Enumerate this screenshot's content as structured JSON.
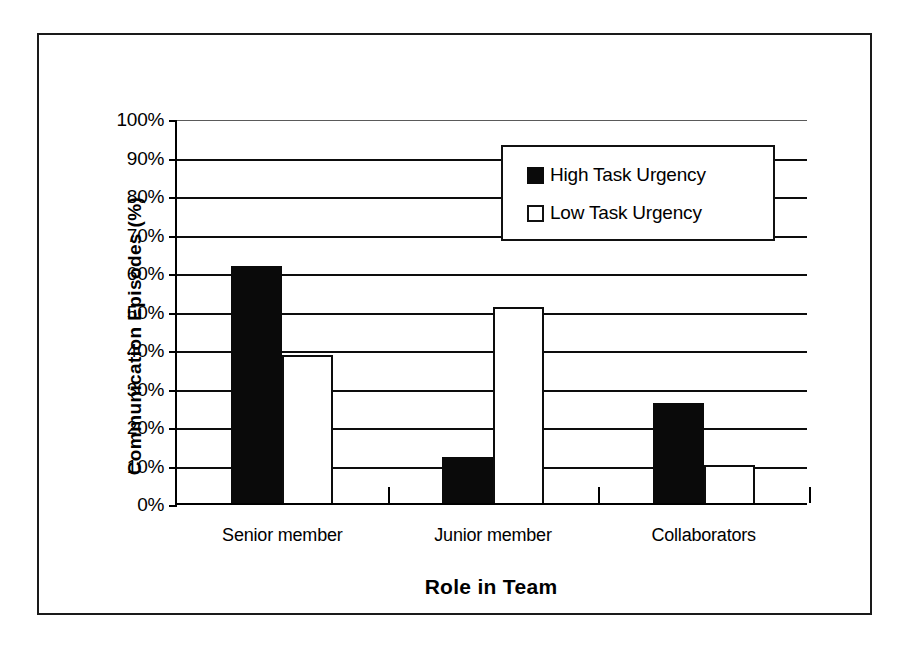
{
  "chart_data": {
    "type": "bar",
    "title": "",
    "xlabel": "Role in Team",
    "ylabel": "Communication Episodes (%)",
    "categories": [
      "Senior member",
      "Junior member",
      "Collaborators"
    ],
    "series": [
      {
        "name": "High Task Urgency",
        "color": "#000000",
        "values": [
          61.5,
          12.0,
          26.0
        ]
      },
      {
        "name": "Low Task Urgency",
        "color": "#ffffff",
        "values": [
          38.5,
          51.0,
          10.0
        ]
      }
    ],
    "ylim": [
      0,
      100
    ],
    "ytick_labels": [
      "100%",
      "90%",
      "80%",
      "70%",
      "60%",
      "50%",
      "40%",
      "30%",
      "20%",
      "10%",
      "0%"
    ],
    "ytick_values": [
      100,
      90,
      80,
      70,
      60,
      50,
      40,
      30,
      20,
      10,
      0
    ],
    "grid": "horizontal",
    "legend_position": "top-right-inside",
    "value_unit": "%"
  },
  "legend": {
    "entries": [
      {
        "label": "High Task Urgency",
        "swatch": "filled-black-square"
      },
      {
        "label": "Low Task Urgency",
        "swatch": "open-white-square"
      }
    ]
  }
}
